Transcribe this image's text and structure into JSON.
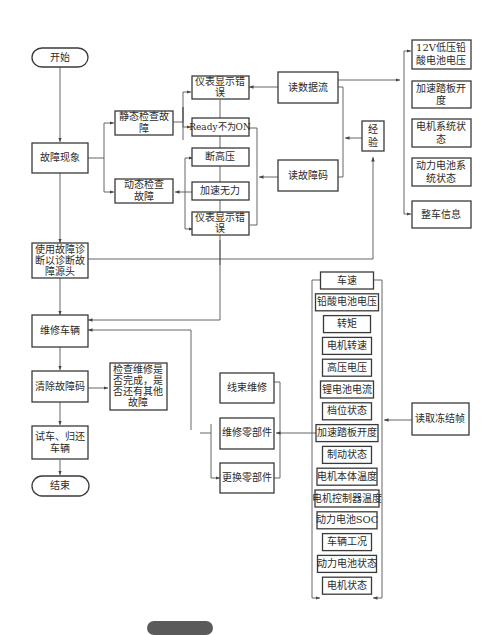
{
  "diagram": {
    "start": "开始",
    "end": "结束",
    "fault_symptom": "故障现象",
    "static_check": [
      "静态检查故",
      "障"
    ],
    "dynamic_check": [
      "动态检查",
      "故障"
    ],
    "instrument_error_1": [
      "仪表显示错",
      "误"
    ],
    "ready_not_on": "Ready不为ON",
    "hv_cut": "断高压",
    "accel_weak": "加速无力",
    "instrument_error_2": [
      "仪表显示错",
      "误"
    ],
    "read_data_stream": "读数据流",
    "read_fault_code": "读故障码",
    "experience": [
      "经",
      "验"
    ],
    "data_stream_items": [
      [
        "12V低压铅",
        "酸电池电压"
      ],
      [
        "加速踏板开",
        "度"
      ],
      [
        "电机系统状",
        "态"
      ],
      [
        "动力电池系",
        "统状态"
      ],
      [
        "整车信息"
      ]
    ],
    "use_diagnosis": [
      "使用故障诊",
      "断以诊断故",
      "障源头"
    ],
    "repair_vehicle": "维修车辆",
    "clear_fault_code": "清除故障码",
    "check_repair": [
      "检查维修是",
      "否完成，是",
      "否还有其他",
      "故障"
    ],
    "test_return": [
      "试车、归还",
      "车辆"
    ],
    "repair_options": [
      "线束维修",
      "维修零部件",
      "更换零部件"
    ],
    "freeze_frame": "读取冻结帧",
    "freeze_frame_items": [
      "车速",
      "铅酸电池电压",
      "转矩",
      "电机转速",
      "高压电压",
      "锂电池电流",
      "档位状态",
      "加速踏板开度",
      "制动状态",
      "电机本体温度",
      "电机控制器温度",
      "动力电池SOC",
      "车辆工况",
      "动力电池状态",
      "电机状态"
    ]
  }
}
